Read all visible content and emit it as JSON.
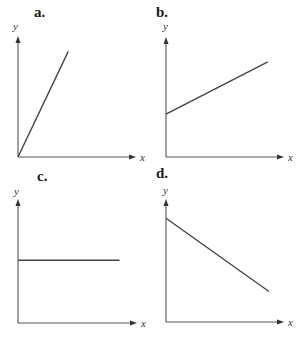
{
  "chart_data": [
    {
      "type": "line",
      "panel": "a.",
      "title": "a.",
      "xlabel": "x",
      "ylabel": "y",
      "xlim": [
        0,
        1
      ],
      "ylim": [
        0,
        1
      ],
      "grid": false,
      "series": [
        {
          "name": "line",
          "x": [
            0,
            0.43
          ],
          "y": [
            0,
            0.88
          ]
        }
      ],
      "description": "Steep positive slope through origin"
    },
    {
      "type": "line",
      "panel": "b.",
      "title": "b.",
      "xlabel": "x",
      "ylabel": "y",
      "xlim": [
        0,
        1
      ],
      "ylim": [
        0,
        1
      ],
      "grid": false,
      "series": [
        {
          "name": "line",
          "x": [
            0,
            0.87
          ],
          "y": [
            0.36,
            0.8
          ]
        }
      ],
      "description": "Positive slope with positive y-intercept"
    },
    {
      "type": "line",
      "panel": "c.",
      "title": "c.",
      "xlabel": "x",
      "ylabel": "y",
      "xlim": [
        0,
        1
      ],
      "ylim": [
        0,
        1
      ],
      "grid": false,
      "series": [
        {
          "name": "line",
          "x": [
            0,
            0.86
          ],
          "y": [
            0.51,
            0.51
          ]
        }
      ],
      "description": "Horizontal line (zero slope)"
    },
    {
      "type": "line",
      "panel": "d.",
      "title": "d.",
      "xlabel": "x",
      "ylabel": "y",
      "xlim": [
        0,
        1
      ],
      "ylim": [
        0,
        1
      ],
      "grid": false,
      "series": [
        {
          "name": "line",
          "x": [
            0,
            0.88
          ],
          "y": [
            0.85,
            0.25
          ]
        }
      ],
      "description": "Negative slope"
    }
  ],
  "colors": {
    "axis": "#555555",
    "line": "#444444",
    "text": "#1a1a1a"
  }
}
